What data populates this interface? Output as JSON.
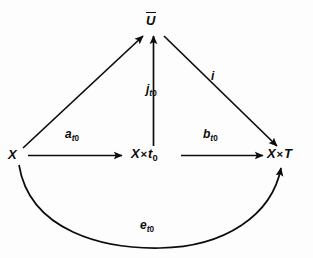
{
  "figure": {
    "kind": "commutative-diagram",
    "background_color": "#fdfdfd",
    "ink_color": "#0c0c0c",
    "width": 313,
    "height": 258
  },
  "nodes": [
    {
      "id": "x",
      "name": "node-x",
      "label": "X",
      "base": "X",
      "overline": false,
      "x": 17,
      "y": 155
    },
    {
      "id": "x_times_t0",
      "name": "node-x-times-t0",
      "label": "X×t₀",
      "base": "X",
      "operator": "×",
      "operand": "t",
      "subscript": "0",
      "overline": false,
      "x": 152,
      "y": 155
    },
    {
      "id": "x_times_T",
      "name": "node-x-times-T",
      "label": "X×T",
      "base": "X",
      "operator": "×",
      "operand": "T",
      "overline": false,
      "x": 284,
      "y": 155
    },
    {
      "id": "u_bar",
      "name": "node-u-bar",
      "label": "Ū",
      "base": "U",
      "overline": true,
      "x": 152,
      "y": 20
    }
  ],
  "edges": [
    {
      "id": "a_t0",
      "name": "edge-a-t0",
      "from": "x",
      "to": "x_times_t0",
      "label_base": "a",
      "label_sub": "t",
      "label_subsub": "0",
      "label_plain": "a_t0",
      "style": "straight",
      "arrowhead": "end"
    },
    {
      "id": "b_t0",
      "name": "edge-b-t0",
      "from": "x_times_t0",
      "to": "x_times_T",
      "label_base": "b",
      "label_sub": "t",
      "label_subsub": "0",
      "label_plain": "b_t0",
      "style": "straight",
      "arrowhead": "end"
    },
    {
      "id": "j_t0",
      "name": "edge-j-t0",
      "from": "x_times_t0",
      "to": "u_bar",
      "label_base": "j",
      "label_sub": "t",
      "label_subsub": "0",
      "label_plain": "j_t0",
      "style": "straight",
      "arrowhead": "end"
    },
    {
      "id": "f_diagonal_left",
      "name": "edge-x-to-u-bar",
      "from": "x",
      "to": "u_bar",
      "label_base": "",
      "label_plain": "",
      "style": "straight",
      "arrowhead": "end"
    },
    {
      "id": "i",
      "name": "edge-i",
      "from": "u_bar",
      "to": "x_times_T",
      "label_base": "i",
      "label_plain": "i",
      "style": "straight",
      "arrowhead": "end"
    },
    {
      "id": "e_t0",
      "name": "edge-e-t0",
      "from": "x",
      "to": "x_times_T",
      "label_base": "e",
      "label_sub": "t",
      "label_subsub": "0",
      "label_plain": "e_t0",
      "style": "curved-arc-below",
      "arrowhead": "end"
    }
  ]
}
